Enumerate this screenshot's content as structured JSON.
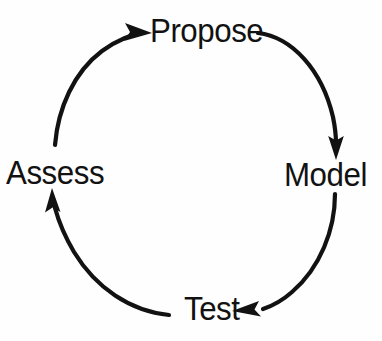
{
  "diagram": {
    "type": "cyclic-process",
    "title": "",
    "direction": "clockwise",
    "background_color": "#fefefe",
    "stroke_color": "#121212",
    "text_color": "#121212",
    "nodes": [
      {
        "id": "propose",
        "label": "Propose",
        "position": "top"
      },
      {
        "id": "model",
        "label": "Model",
        "position": "right"
      },
      {
        "id": "test",
        "label": "Test",
        "position": "bottom"
      },
      {
        "id": "assess",
        "label": "Assess",
        "position": "left"
      }
    ],
    "arrows": [
      {
        "id": "propose-to-model",
        "from": "propose",
        "to": "model",
        "arrowhead": "down"
      },
      {
        "id": "model-to-test",
        "from": "model",
        "to": "test",
        "arrowhead": "left"
      },
      {
        "id": "test-to-assess",
        "from": "test",
        "to": "assess",
        "arrowhead": "up"
      },
      {
        "id": "assess-to-propose",
        "from": "assess",
        "to": "propose",
        "arrowhead": "right"
      }
    ]
  }
}
